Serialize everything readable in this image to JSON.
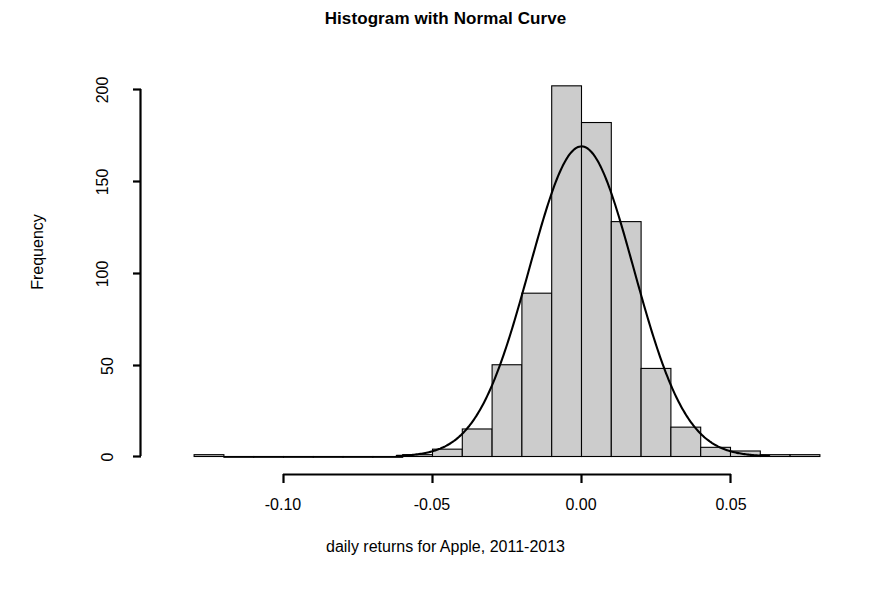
{
  "chart_data": {
    "type": "bar",
    "title": "Histogram with Normal Curve",
    "xlabel": "daily returns for Apple, 2011-2013",
    "ylabel": "Frequency",
    "grid": false,
    "legend": "none",
    "xlim": [
      -0.135,
      0.085
    ],
    "ylim": [
      0,
      205
    ],
    "xticks": [
      -0.1,
      -0.05,
      0.0,
      0.05
    ],
    "xtick_labels": [
      "-0.10",
      "-0.05",
      "0.00",
      "0.05"
    ],
    "yticks": [
      0,
      50,
      100,
      150,
      200
    ],
    "ytick_labels": [
      "0",
      "50",
      "100",
      "150",
      "200"
    ],
    "bin_width": 0.01,
    "bin_edges": [
      -0.13,
      -0.12,
      -0.11,
      -0.1,
      -0.09,
      -0.08,
      -0.07,
      -0.06,
      -0.05,
      -0.04,
      -0.03,
      -0.02,
      -0.01,
      0.0,
      0.01,
      0.02,
      0.03,
      0.04,
      0.05,
      0.06,
      0.07,
      0.08
    ],
    "categories": [
      "-0.13",
      "-0.12",
      "-0.11",
      "-0.10",
      "-0.09",
      "-0.08",
      "-0.07",
      "-0.06",
      "-0.05",
      "-0.04",
      "-0.03",
      "-0.02",
      "-0.01",
      "0.00",
      "0.01",
      "0.02",
      "0.03",
      "0.04",
      "0.05",
      "0.06",
      "0.07"
    ],
    "values": [
      1,
      0,
      0,
      0,
      0,
      0,
      0,
      1,
      4,
      15,
      50,
      89,
      202,
      182,
      128,
      48,
      16,
      5,
      3,
      1,
      1
    ],
    "bar_fill": "#cccccc",
    "bar_stroke": "#000000",
    "curve": {
      "name": "Normal Curve",
      "mean": 0.0,
      "sd": 0.0175,
      "peak_value": 169,
      "color": "#000000"
    }
  },
  "axis": {
    "x_axis_name": "x-axis",
    "y_axis_name": "y-axis"
  }
}
